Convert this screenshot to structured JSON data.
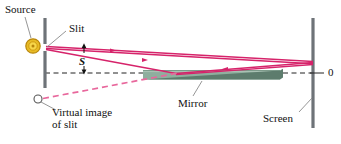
{
  "figure": {
    "kind": "optics-ray-diagram",
    "title_visible": false,
    "background": "#ffffff"
  },
  "labels": {
    "source": "Source",
    "slit": "Slit",
    "s_symbol": "S",
    "mirror": "Mirror",
    "virtual_line1": "Virtual image",
    "virtual_line2": "of slit",
    "screen": "Screen",
    "origin": "0"
  },
  "colors": {
    "ray": "#d6236a",
    "ray_virtual": "#e8679c",
    "source_fill": "#f5c518",
    "source_ring": "#c8900a",
    "barrier": "#6e7378",
    "screen": "#6e7378",
    "mirror_face": "#8fae9e",
    "mirror_edge": "#5d7c6d",
    "axis": "#222222",
    "leader": "#8a8a8a",
    "text": "#111111"
  },
  "elements": {
    "source_point": {
      "name": "light-source",
      "x": 33,
      "y": 46,
      "r": 7
    },
    "virtual_image_point": {
      "name": "virtual-image-of-slit",
      "x": 38,
      "y": 99,
      "r": 4
    },
    "slit_gap": {
      "name": "slit-aperture",
      "x": 45,
      "y": 48
    },
    "barrier": {
      "name": "slit-barrier",
      "x": 45,
      "y_top": 18,
      "y_bottom": 88
    },
    "screen_bar": {
      "name": "observation-screen",
      "x": 313,
      "y_top": 18,
      "y_bottom": 128
    },
    "mirror_bar": {
      "name": "mirror-surface",
      "x_left": 143,
      "x_right": 280,
      "y_top": 70,
      "y_bottom": 80
    },
    "optical_axis": {
      "name": "optical-axis-dashed",
      "x1": 45,
      "x2": 313,
      "y": 73
    },
    "dimension_s": {
      "name": "slit-height-dimension",
      "x": 84,
      "y_top": 45,
      "y_bottom": 73
    }
  },
  "rays": {
    "direct_ray": {
      "name": "direct-ray-slit-to-screen",
      "from": [
        46,
        47
      ],
      "to": [
        313,
        62
      ]
    },
    "reflected_incident": {
      "name": "incident-ray-to-mirror",
      "from": [
        46,
        48
      ],
      "to": [
        175,
        74
      ]
    },
    "reflected_outgoing": {
      "name": "reflected-ray-to-screen",
      "from": [
        175,
        74
      ],
      "to": [
        313,
        63
      ]
    },
    "upper_return_ray": {
      "name": "upper-ray-to-screen",
      "from": [
        313,
        62
      ],
      "to": [
        46,
        47
      ]
    },
    "virtual_ray": {
      "name": "virtual-ray-dashed",
      "from": [
        42,
        99
      ],
      "to": [
        175,
        74
      ]
    }
  },
  "arrow_markers": [
    {
      "name": "ray-arrow-direct",
      "x": 120,
      "y": 50
    },
    {
      "name": "ray-arrow-reflected",
      "x": 228,
      "y": 68
    }
  ]
}
